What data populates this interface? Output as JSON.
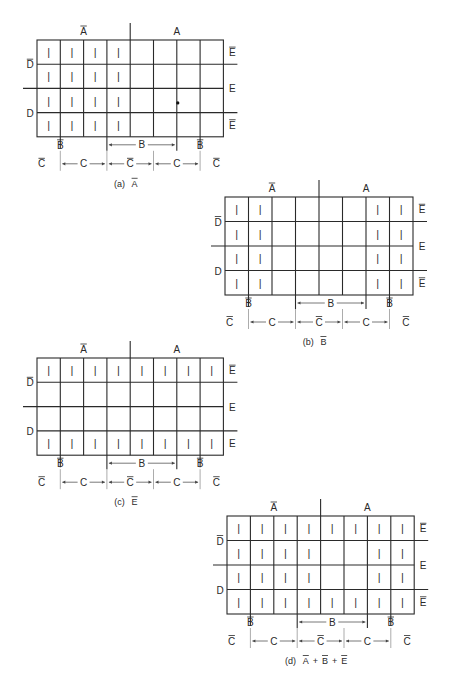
{
  "figure": {
    "maps": [
      {
        "id": "a",
        "caption_prefix": "(a)",
        "caption_terms": [
          {
            "v": "A",
            "bar": true
          }
        ],
        "origin": [
          37,
          40
        ],
        "cell_w": 23.3,
        "cell_h": 24.2,
        "ones_symbol": "|",
        "cells": [
          [
            1,
            1,
            1,
            1,
            0,
            0,
            0,
            0
          ],
          [
            1,
            1,
            1,
            1,
            0,
            0,
            0,
            0
          ],
          [
            1,
            1,
            1,
            1,
            0,
            0,
            0,
            0
          ],
          [
            1,
            1,
            1,
            1,
            0,
            0,
            0,
            0
          ]
        ],
        "right_labels": [
          {
            "v": "E",
            "bar": true
          },
          {
            "v": "E",
            "bar": false
          },
          {
            "v": "E",
            "bar": true
          }
        ],
        "dot": true
      },
      {
        "id": "b",
        "caption_prefix": "(b)",
        "caption_terms": [
          {
            "v": "B",
            "bar": true
          }
        ],
        "origin": [
          225,
          197
        ],
        "cell_w": 23.5,
        "cell_h": 24.5,
        "ones_symbol": "|",
        "cells": [
          [
            1,
            1,
            0,
            0,
            0,
            0,
            1,
            1
          ],
          [
            1,
            1,
            0,
            0,
            0,
            0,
            1,
            1
          ],
          [
            1,
            1,
            0,
            0,
            0,
            0,
            1,
            1
          ],
          [
            1,
            1,
            0,
            0,
            0,
            0,
            1,
            1
          ]
        ],
        "right_labels": [
          {
            "v": "E",
            "bar": true
          },
          {
            "v": "E",
            "bar": false
          },
          {
            "v": "E",
            "bar": true
          }
        ],
        "dot": false
      },
      {
        "id": "c",
        "caption_prefix": "(c)",
        "caption_terms": [
          {
            "v": "E",
            "bar": true
          }
        ],
        "origin": [
          37,
          358
        ],
        "cell_w": 23.3,
        "cell_h": 24.3,
        "ones_symbol": "|",
        "cells": [
          [
            1,
            1,
            1,
            1,
            1,
            1,
            1,
            1
          ],
          [
            0,
            0,
            0,
            0,
            0,
            0,
            0,
            0
          ],
          [
            0,
            0,
            0,
            0,
            0,
            0,
            0,
            0
          ],
          [
            1,
            1,
            1,
            1,
            1,
            1,
            1,
            1
          ]
        ],
        "right_labels": [
          {
            "v": "E",
            "bar": true
          },
          {
            "v": "E",
            "bar": false
          },
          {
            "v": "E",
            "bar": false
          }
        ],
        "dot": false
      },
      {
        "id": "d",
        "caption_prefix": "(d)",
        "caption_terms": [
          {
            "v": "A",
            "bar": true
          },
          {
            "op": "+"
          },
          {
            "v": "B",
            "bar": true
          },
          {
            "op": "+"
          },
          {
            "v": "E",
            "bar": true
          }
        ],
        "origin": [
          227,
          516
        ],
        "cell_w": 23.4,
        "cell_h": 24.5,
        "ones_symbol": "|",
        "cells": [
          [
            1,
            1,
            1,
            1,
            1,
            1,
            1,
            1
          ],
          [
            1,
            1,
            1,
            1,
            0,
            0,
            1,
            1
          ],
          [
            1,
            1,
            1,
            1,
            0,
            0,
            1,
            1
          ],
          [
            1,
            1,
            1,
            1,
            1,
            1,
            1,
            1
          ]
        ],
        "right_labels": [
          {
            "v": "E",
            "bar": true
          },
          {
            "v": "E",
            "bar": false
          },
          {
            "v": "E",
            "bar": true
          }
        ],
        "dot": false
      }
    ],
    "axis_labels": {
      "top": [
        {
          "v": "A",
          "bar": true,
          "col": 2
        },
        {
          "v": "A",
          "bar": false,
          "col": 6
        }
      ],
      "left": [
        {
          "v": "D",
          "bar": true,
          "row": 1
        },
        {
          "v": "D",
          "bar": false,
          "row": 3
        }
      ],
      "b_row": [
        {
          "v": "B",
          "bar": true,
          "col": 1
        },
        {
          "v": "B",
          "bar": false,
          "span": [
            3,
            7
          ]
        },
        {
          "v": "B",
          "bar": true,
          "col": 7
        }
      ],
      "c_row": [
        {
          "v": "C",
          "bar": true,
          "pos": "left"
        },
        {
          "v": "C",
          "bar": false,
          "span": [
            1,
            3
          ]
        },
        {
          "v": "C",
          "bar": true,
          "span": [
            3,
            5
          ]
        },
        {
          "v": "C",
          "bar": false,
          "span": [
            5,
            7
          ]
        },
        {
          "v": "C",
          "bar": true,
          "pos": "right"
        }
      ]
    }
  }
}
